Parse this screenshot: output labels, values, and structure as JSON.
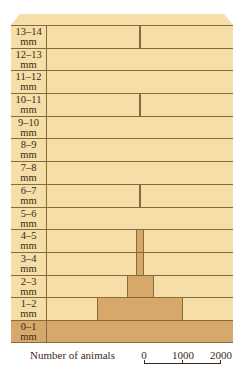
{
  "chart_data": {
    "type": "bar",
    "subtype": "centered-horizontal-histogram (population pyramid)",
    "categories": [
      "13–14 mm",
      "12–13 mm",
      "11–12 mm",
      "10–11 mm",
      "9–10 mm",
      "8–9 mm",
      "7–8 mm",
      "6–7 mm",
      "5–6 mm",
      "4–5 mm",
      "3–4 mm",
      "2–3 mm",
      "1–2 mm",
      "0–1 mm"
    ],
    "values": [
      20,
      0,
      0,
      20,
      0,
      0,
      0,
      20,
      0,
      200,
      200,
      700,
      2250,
      4800
    ],
    "xlabel": "Number of animals",
    "scale_ticks": [
      "0",
      "1000",
      "2000"
    ]
  },
  "rows": [
    {
      "l1": "13–14",
      "l2": "mm",
      "width": 2,
      "thin": true
    },
    {
      "l1": "12–13",
      "l2": "mm",
      "width": 0
    },
    {
      "l1": "11–12",
      "l2": "mm",
      "width": 0
    },
    {
      "l1": "10–11",
      "l2": "mm",
      "width": 2,
      "thin": true
    },
    {
      "l1": "9–10",
      "l2": "mm",
      "width": 0
    },
    {
      "l1": "8–9",
      "l2": "mm",
      "width": 0
    },
    {
      "l1": "7–8",
      "l2": "mm",
      "width": 0
    },
    {
      "l1": "6–7",
      "l2": "mm",
      "width": 2,
      "thin": true
    },
    {
      "l1": "5–6",
      "l2": "mm",
      "width": 0
    },
    {
      "l1": "4–5",
      "l2": "mm",
      "width": 8
    },
    {
      "l1": "3–4",
      "l2": "mm",
      "width": 8
    },
    {
      "l1": "2–3",
      "l2": "mm",
      "width": 27
    },
    {
      "l1": "1–2",
      "l2": "mm",
      "width": 86
    },
    {
      "l1": "0–1",
      "l2": "mm",
      "width": 186,
      "full": true
    }
  ],
  "axis": {
    "label": "Number of animals",
    "ticks": [
      "0",
      "1000",
      "2000"
    ]
  }
}
